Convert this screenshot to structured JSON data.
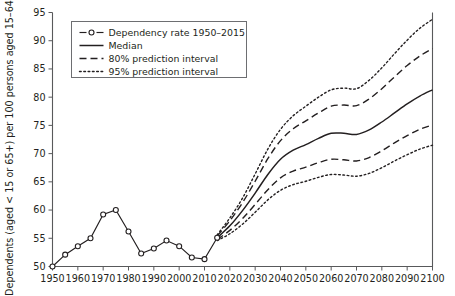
{
  "chart_data": {
    "type": "line",
    "title": "",
    "xlabel": "",
    "ylabel": "Dependents (aged < 15 or 65+) per 100 persons aged 15–64",
    "xlim": [
      1950,
      2100
    ],
    "ylim": [
      50,
      95
    ],
    "xticks": [
      1950,
      1960,
      1970,
      1980,
      1990,
      2000,
      2010,
      2020,
      2030,
      2040,
      2050,
      2060,
      2070,
      2080,
      2090,
      2100
    ],
    "yticks": [
      50,
      55,
      60,
      65,
      70,
      75,
      80,
      85,
      90,
      95
    ],
    "grid": false,
    "legend_position": "top-left",
    "series": [
      {
        "name": "Dependency rate 1950–2015",
        "style": "solid-with-open-circle-markers",
        "x": [
          1950,
          1955,
          1960,
          1965,
          1970,
          1975,
          1980,
          1985,
          1990,
          1995,
          2000,
          2005,
          2010,
          2015
        ],
        "values": [
          50.0,
          52.1,
          53.6,
          55.0,
          59.2,
          60.0,
          56.2,
          52.3,
          53.2,
          54.6,
          53.6,
          51.6,
          51.3,
          55.1
        ]
      },
      {
        "name": "Median",
        "style": "solid",
        "x": [
          2015,
          2020,
          2025,
          2030,
          2035,
          2040,
          2045,
          2050,
          2055,
          2060,
          2065,
          2070,
          2075,
          2080,
          2085,
          2090,
          2095,
          2100
        ],
        "values": [
          55.1,
          57.2,
          59.9,
          63.0,
          66.3,
          69.0,
          70.6,
          71.6,
          72.7,
          73.6,
          73.6,
          73.4,
          74.2,
          75.6,
          77.2,
          78.8,
          80.2,
          81.3
        ]
      },
      {
        "name": "80% prediction interval",
        "style": "dashed",
        "bounds": "upper",
        "x": [
          2015,
          2020,
          2025,
          2030,
          2035,
          2040,
          2045,
          2050,
          2055,
          2060,
          2065,
          2070,
          2075,
          2080,
          2085,
          2090,
          2095,
          2100
        ],
        "values": [
          55.4,
          58.1,
          61.3,
          65.1,
          69.1,
          72.3,
          74.4,
          75.8,
          77.2,
          78.4,
          78.6,
          78.5,
          79.7,
          81.5,
          83.6,
          85.6,
          87.3,
          88.6
        ]
      },
      {
        "name": "80% prediction interval",
        "style": "dashed",
        "bounds": "lower",
        "x": [
          2015,
          2020,
          2025,
          2030,
          2035,
          2040,
          2045,
          2050,
          2055,
          2060,
          2065,
          2070,
          2075,
          2080,
          2085,
          2090,
          2095,
          2100
        ],
        "values": [
          54.8,
          56.4,
          58.5,
          61.0,
          63.6,
          65.7,
          66.9,
          67.6,
          68.4,
          69.0,
          68.9,
          68.7,
          69.3,
          70.5,
          71.9,
          73.2,
          74.3,
          75.1
        ]
      },
      {
        "name": "95% prediction interval",
        "style": "dotted",
        "bounds": "upper",
        "x": [
          2015,
          2020,
          2025,
          2030,
          2035,
          2040,
          2045,
          2050,
          2055,
          2060,
          2065,
          2070,
          2075,
          2080,
          2085,
          2090,
          2095,
          2100
        ],
        "values": [
          55.6,
          58.6,
          62.1,
          66.4,
          70.8,
          74.3,
          76.7,
          78.4,
          80.0,
          81.3,
          81.6,
          81.5,
          83.0,
          85.2,
          87.7,
          90.1,
          92.2,
          93.8
        ]
      },
      {
        "name": "95% prediction interval",
        "style": "dotted",
        "bounds": "lower",
        "x": [
          2015,
          2020,
          2025,
          2030,
          2035,
          2040,
          2045,
          2050,
          2055,
          2060,
          2065,
          2070,
          2075,
          2080,
          2085,
          2090,
          2095,
          2100
        ],
        "values": [
          54.6,
          55.8,
          57.5,
          59.6,
          61.8,
          63.5,
          64.5,
          65.1,
          65.8,
          66.3,
          66.2,
          66.0,
          66.5,
          67.5,
          68.7,
          69.8,
          70.8,
          71.5
        ]
      }
    ],
    "legend": [
      {
        "label": "Dependency rate 1950–2015",
        "style": "solid-marker"
      },
      {
        "label": "Median",
        "style": "solid"
      },
      {
        "label": "80% prediction interval",
        "style": "dashed"
      },
      {
        "label": "95% prediction interval",
        "style": "dotted"
      }
    ]
  }
}
